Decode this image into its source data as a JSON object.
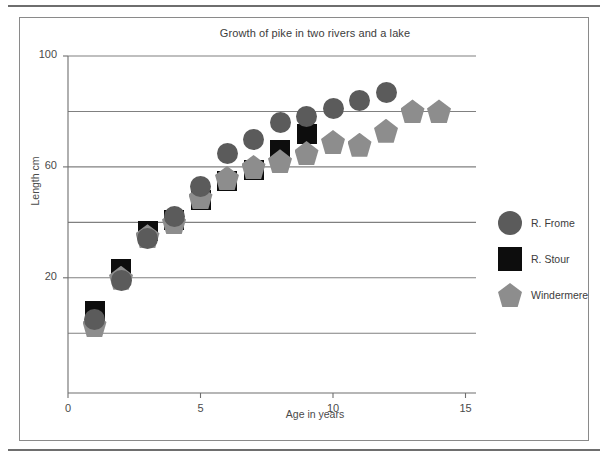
{
  "figure": {
    "title": "Growth of pike in two rivers and a lake"
  },
  "chart_data": {
    "type": "scatter",
    "title": "Growth of pike in two rivers and a lake",
    "xlabel": "Age in years",
    "ylabel": "Length cm",
    "xlim": [
      0,
      15
    ],
    "ylim": [
      -20,
      100
    ],
    "xticks": [
      0,
      5,
      10,
      15
    ],
    "xticklabels": [
      "0",
      "5",
      "10",
      "15"
    ],
    "yticks": [
      20,
      60,
      100
    ],
    "yticklabels": [
      "20",
      "60",
      "100"
    ],
    "gridlines_y": [
      0,
      20,
      40,
      60,
      80,
      100
    ],
    "grid": "horizontal",
    "legend_position": "right",
    "series": [
      {
        "name": "R. Frome",
        "marker": "circle",
        "color": "#5b5b5b",
        "x": [
          1,
          2,
          3,
          4,
          5,
          6,
          7,
          8,
          9,
          10,
          11,
          12
        ],
        "y": [
          5,
          19,
          34,
          42,
          53,
          65,
          70,
          76,
          78,
          81,
          84,
          87
        ]
      },
      {
        "name": "R. Stour",
        "marker": "square",
        "color": "#0d0d0d",
        "x": [
          1,
          2,
          3,
          4,
          5,
          6,
          7,
          8,
          9
        ],
        "y": [
          8,
          23,
          37,
          41,
          48,
          55,
          59,
          66,
          72
        ]
      },
      {
        "name": "Windermere",
        "marker": "pentagon",
        "color": "#8d8d8d",
        "x": [
          1,
          2,
          3,
          4,
          5,
          6,
          7,
          8,
          9,
          10,
          11,
          12,
          13,
          14
        ],
        "y": [
          3,
          20,
          35,
          40,
          49,
          56,
          60,
          62,
          65,
          69,
          68,
          73,
          80,
          80
        ]
      }
    ]
  },
  "legend": {
    "items": [
      {
        "label": "R. Frome",
        "icon": "circle-marker-icon",
        "color": "#5b5b5b"
      },
      {
        "label": "R. Stour",
        "icon": "square-marker-icon",
        "color": "#0d0d0d"
      },
      {
        "label": "Windermere",
        "icon": "pentagon-marker-icon",
        "color": "#8d8d8d"
      }
    ]
  },
  "colors": {
    "frome": "#5b5b5b",
    "stour": "#0d0d0d",
    "windermere": "#8d8d8d",
    "grid": "#808080",
    "axis": "#6e6e6e",
    "text": "#3c3c3c",
    "background": "#ffffff"
  }
}
